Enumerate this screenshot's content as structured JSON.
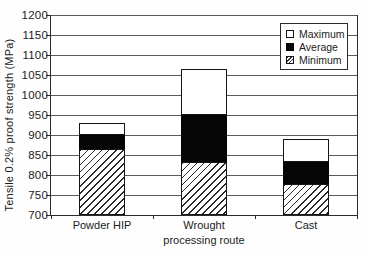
{
  "chart_data": {
    "type": "bar",
    "stacked": true,
    "xlabel": "processing route",
    "ylabel": "Tensile 0.2% proof strength (MPa)",
    "ylim": [
      700,
      1200
    ],
    "ytick_step": 50,
    "yticks": [
      700,
      750,
      800,
      850,
      900,
      950,
      1000,
      1050,
      1100,
      1150,
      1200
    ],
    "grid": true,
    "categories": [
      "Powder HIP",
      "Wrought",
      "Cast"
    ],
    "series": [
      {
        "name": "Maximum",
        "pattern": "white-outline",
        "values": [
          930,
          1065,
          890
        ]
      },
      {
        "name": "Average",
        "pattern": "solid-black",
        "values": [
          900,
          950,
          832
        ]
      },
      {
        "name": "Minimum",
        "pattern": "diagonal-hatch",
        "values": [
          865,
          833,
          778
        ]
      }
    ],
    "legend": {
      "position": "top-right",
      "entries": [
        "Maximum",
        "Average",
        "Minimum"
      ]
    },
    "colors": {
      "foreground": "#1c1c1c",
      "average_fill": "#000000",
      "maximum_fill": "#ffffff"
    }
  }
}
